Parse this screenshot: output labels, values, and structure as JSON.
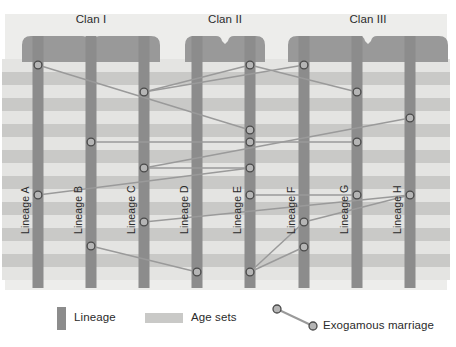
{
  "figure": {
    "title_present": false,
    "clans": [
      {
        "id": "clan-1",
        "label": "Clan I",
        "bracket_x": 22,
        "bracket_w": 138
      },
      {
        "id": "clan-2",
        "label": "Clan II",
        "bracket_x": 185,
        "bracket_w": 80
      },
      {
        "id": "clan-3",
        "label": "Clan III",
        "bracket_x": 288,
        "bracket_w": 160
      }
    ],
    "lineages": [
      {
        "id": "lineage-a",
        "label": "Lineage A",
        "x": 38,
        "clan": "Clan I"
      },
      {
        "id": "lineage-b",
        "label": "Lineage B",
        "x": 91,
        "clan": "Clan I"
      },
      {
        "id": "lineage-c",
        "label": "Lineage C",
        "x": 144,
        "clan": "Clan I"
      },
      {
        "id": "lineage-d",
        "label": "Lineage D",
        "x": 197,
        "clan": "Clan II"
      },
      {
        "id": "lineage-e",
        "label": "Lineage E",
        "x": 250,
        "clan": "Clan II"
      },
      {
        "id": "lineage-f",
        "label": "Lineage F",
        "x": 304,
        "clan": "Clan III"
      },
      {
        "id": "lineage-g",
        "label": "Lineage G",
        "x": 357,
        "clan": "Clan III"
      },
      {
        "id": "lineage-h",
        "label": "Lineage H",
        "x": 410,
        "clan": "Clan III"
      }
    ],
    "age_sets": [
      {
        "index": 1,
        "y": 59,
        "h": 13,
        "tone": "light"
      },
      {
        "index": 2,
        "y": 72,
        "h": 13,
        "tone": "dark"
      },
      {
        "index": 3,
        "y": 85,
        "h": 13,
        "tone": "light"
      },
      {
        "index": 4,
        "y": 98,
        "h": 13,
        "tone": "dark"
      },
      {
        "index": 5,
        "y": 111,
        "h": 13,
        "tone": "light"
      },
      {
        "index": 6,
        "y": 124,
        "h": 13,
        "tone": "dark"
      },
      {
        "index": 7,
        "y": 137,
        "h": 13,
        "tone": "light"
      },
      {
        "index": 8,
        "y": 150,
        "h": 13,
        "tone": "dark"
      },
      {
        "index": 9,
        "y": 163,
        "h": 13,
        "tone": "light"
      },
      {
        "index": 10,
        "y": 176,
        "h": 13,
        "tone": "dark"
      },
      {
        "index": 11,
        "y": 189,
        "h": 13,
        "tone": "light"
      },
      {
        "index": 12,
        "y": 202,
        "h": 13,
        "tone": "dark"
      },
      {
        "index": 13,
        "y": 215,
        "h": 13,
        "tone": "light"
      },
      {
        "index": 14,
        "y": 228,
        "h": 13,
        "tone": "dark"
      },
      {
        "index": 15,
        "y": 241,
        "h": 13,
        "tone": "light"
      },
      {
        "index": 16,
        "y": 254,
        "h": 13,
        "tone": "dark"
      },
      {
        "index": 17,
        "y": 267,
        "h": 13,
        "tone": "light"
      }
    ],
    "marriages": [
      {
        "from": {
          "lineage": "Lineage A",
          "x": 38,
          "y": 65
        },
        "to": {
          "lineage": "Lineage E",
          "x": 250,
          "y": 130
        }
      },
      {
        "from": {
          "lineage": "Lineage C",
          "x": 144,
          "y": 92
        },
        "to": {
          "lineage": "Lineage E",
          "x": 250,
          "y": 65
        }
      },
      {
        "from": {
          "lineage": "Lineage E",
          "x": 250,
          "y": 65
        },
        "to": {
          "lineage": "Lineage G",
          "x": 357,
          "y": 92
        }
      },
      {
        "from": {
          "lineage": "Lineage F",
          "x": 304,
          "y": 65
        },
        "to": {
          "lineage": "Lineage C",
          "x": 144,
          "y": 92
        }
      },
      {
        "from": {
          "lineage": "Lineage B",
          "x": 91,
          "y": 142
        },
        "to": {
          "lineage": "Lineage E",
          "x": 250,
          "y": 142
        }
      },
      {
        "from": {
          "lineage": "Lineage E",
          "x": 250,
          "y": 142
        },
        "to": {
          "lineage": "Lineage G",
          "x": 357,
          "y": 142
        }
      },
      {
        "from": {
          "lineage": "Lineage C",
          "x": 144,
          "y": 168
        },
        "to": {
          "lineage": "Lineage E",
          "x": 250,
          "y": 168
        }
      },
      {
        "from": {
          "lineage": "Lineage C",
          "x": 144,
          "y": 168
        },
        "to": {
          "lineage": "Lineage H",
          "x": 410,
          "y": 118
        }
      },
      {
        "from": {
          "lineage": "Lineage A",
          "x": 38,
          "y": 195
        },
        "to": {
          "lineage": "Lineage E",
          "x": 250,
          "y": 168
        }
      },
      {
        "from": {
          "lineage": "Lineage C",
          "x": 144,
          "y": 222
        },
        "to": {
          "lineage": "Lineage H",
          "x": 410,
          "y": 195
        }
      },
      {
        "from": {
          "lineage": "Lineage E",
          "x": 250,
          "y": 195
        },
        "to": {
          "lineage": "Lineage G",
          "x": 357,
          "y": 195
        }
      },
      {
        "from": {
          "lineage": "Lineage B",
          "x": 91,
          "y": 246
        },
        "to": {
          "lineage": "Lineage D",
          "x": 197,
          "y": 272
        }
      },
      {
        "from": {
          "lineage": "Lineage E",
          "x": 250,
          "y": 272
        },
        "to": {
          "lineage": "Lineage F",
          "x": 304,
          "y": 222
        }
      },
      {
        "from": {
          "lineage": "Lineage E",
          "x": 250,
          "y": 272
        },
        "to": {
          "lineage": "Lineage F",
          "x": 304,
          "y": 247
        }
      },
      {
        "from": {
          "lineage": "Lineage F",
          "x": 304,
          "y": 222
        },
        "to": {
          "lineage": "Lineage H",
          "x": 410,
          "y": 195
        }
      }
    ],
    "legend": [
      {
        "id": "legend-lineage",
        "label": "Lineage",
        "swatch": "lineage-bar-swatch"
      },
      {
        "id": "legend-age-sets",
        "label": "Age sets",
        "swatch": "age-set-band-swatch"
      },
      {
        "id": "legend-marriage",
        "label": "Exogamous marriage",
        "swatch": "marriage-link-swatch"
      }
    ],
    "colors": {
      "panel_background": "#ededeb",
      "lineage_bar": "#8c8c8c",
      "clan_bracket": "#999999",
      "age_set_light": "#e4e4e2",
      "age_set_dark": "#c9c9c7",
      "marriage_line": "#9a9a9a",
      "marriage_node_fill": "#b5b5b5",
      "marriage_node_stroke": "#4a4a4a",
      "text": "#2b2b2b"
    }
  }
}
